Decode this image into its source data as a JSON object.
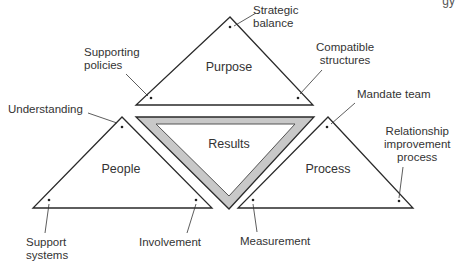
{
  "header_fragment": "gy",
  "triangles": {
    "purpose": {
      "title": "Purpose"
    },
    "people": {
      "title": "People"
    },
    "process": {
      "title": "Process"
    },
    "results": {
      "title": "Results"
    }
  },
  "annotations": {
    "strategic_balance": [
      "Strategic",
      "balance"
    ],
    "supporting_policies": [
      "Supporting",
      "policies"
    ],
    "compatible_structures": [
      "Compatible",
      "structures"
    ],
    "understanding": "Understanding",
    "mandate_team": "Mandate team",
    "relationship_improvement_process": [
      "Relationship",
      "improvement",
      "process"
    ],
    "support_systems": [
      "Support",
      "systems"
    ],
    "involvement": "Involvement",
    "measurement": "Measurement"
  },
  "colors": {
    "line": "#2a2a2a",
    "results_band": "#c8c8c8",
    "background": "#ffffff"
  }
}
